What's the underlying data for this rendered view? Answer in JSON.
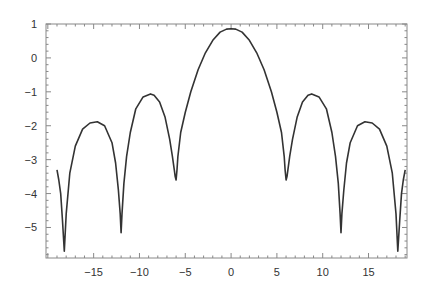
{
  "chart_data": {
    "type": "line",
    "title": "",
    "xlabel": "",
    "ylabel": "",
    "xlim": [
      -20.2,
      19.2
    ],
    "ylim": [
      -5.9,
      1.0
    ],
    "grid": false,
    "legend": null,
    "frame": true,
    "line_color": "#333333",
    "x_ticks": [
      -15,
      -10,
      -5,
      0,
      5,
      10,
      15
    ],
    "x_tick_labels": [
      "−15",
      "−10",
      "−5",
      "0",
      "5",
      "10",
      "15"
    ],
    "y_ticks": [
      1,
      0,
      -1,
      -2,
      -3,
      -4,
      -5
    ],
    "y_tick_labels": [
      "1",
      "0",
      "−1",
      "−2",
      "−3",
      "−4",
      "−5"
    ],
    "series": [
      {
        "name": "curve",
        "x": [
          -19.0,
          -18.8,
          -18.6,
          -18.4,
          -18.2,
          -18.0,
          -17.6,
          -17.0,
          -16.2,
          -15.4,
          -14.6,
          -13.8,
          -13.0,
          -12.6,
          -12.3,
          -12.1,
          -12.0,
          -11.9,
          -11.7,
          -11.4,
          -11.0,
          -10.4,
          -9.6,
          -8.8,
          -8.4,
          -7.8,
          -7.2,
          -6.7,
          -6.4,
          -6.2,
          -6.1,
          -6.0,
          -5.9,
          -5.8,
          -5.5,
          -5.0,
          -4.4,
          -3.6,
          -2.8,
          -2.0,
          -1.2,
          -0.5,
          0.0,
          0.5,
          1.2,
          2.0,
          2.8,
          3.6,
          4.4,
          5.0,
          5.5,
          5.8,
          5.9,
          6.0,
          6.1,
          6.2,
          6.4,
          6.7,
          7.2,
          7.8,
          8.4,
          8.8,
          9.6,
          10.4,
          11.0,
          11.4,
          11.7,
          11.9,
          12.0,
          12.1,
          12.3,
          12.6,
          13.0,
          13.8,
          14.6,
          15.4,
          16.2,
          17.0,
          17.6,
          18.0,
          18.2,
          18.4,
          18.6,
          18.8,
          19.0
        ],
        "y": [
          -3.3,
          -3.6,
          -4.0,
          -4.8,
          -5.7,
          -4.6,
          -3.4,
          -2.6,
          -2.1,
          -1.92,
          -1.88,
          -2.0,
          -2.5,
          -3.1,
          -3.9,
          -4.6,
          -5.15,
          -4.6,
          -3.7,
          -2.9,
          -2.2,
          -1.5,
          -1.15,
          -1.06,
          -1.1,
          -1.3,
          -1.75,
          -2.4,
          -2.9,
          -3.3,
          -3.5,
          -3.6,
          -3.3,
          -2.9,
          -2.2,
          -1.6,
          -1.0,
          -0.35,
          0.15,
          0.52,
          0.76,
          0.85,
          0.86,
          0.85,
          0.76,
          0.52,
          0.15,
          -0.35,
          -1.0,
          -1.6,
          -2.2,
          -2.9,
          -3.3,
          -3.6,
          -3.5,
          -3.3,
          -2.9,
          -2.4,
          -1.75,
          -1.3,
          -1.1,
          -1.06,
          -1.15,
          -1.5,
          -2.2,
          -2.9,
          -3.7,
          -4.6,
          -5.15,
          -4.6,
          -3.9,
          -3.1,
          -2.5,
          -2.0,
          -1.88,
          -1.92,
          -2.1,
          -2.6,
          -3.4,
          -4.6,
          -5.7,
          -4.8,
          -4.0,
          -3.6,
          -3.3
        ]
      }
    ],
    "annotations": []
  },
  "layout": {
    "frame": {
      "left": 46,
      "top": 24,
      "right": 407,
      "bottom": 258
    }
  }
}
